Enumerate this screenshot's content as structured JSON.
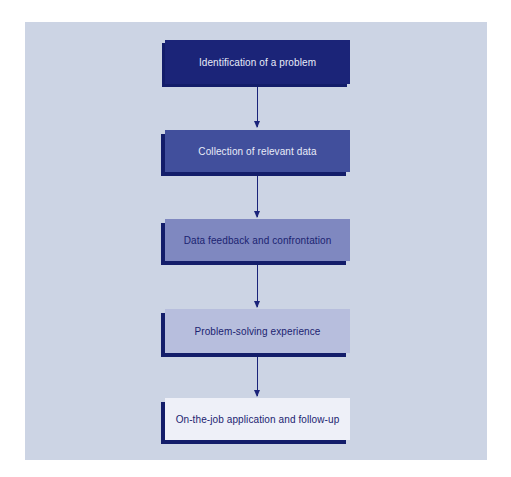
{
  "diagram": {
    "type": "flowchart",
    "direction": "top-to-bottom",
    "steps": [
      {
        "label": "Identification of a problem",
        "fill": "#1b2478",
        "text_color": "#e8ecf8"
      },
      {
        "label": "Collection of relevant data",
        "fill": "#414f9c",
        "text_color": "#e8ecf8"
      },
      {
        "label": "Data feedback and confrontation",
        "fill": "#7f88c0",
        "text_color": "#1b2370"
      },
      {
        "label": "Problem-solving experience",
        "fill": "#b7bedd",
        "text_color": "#1b2370"
      },
      {
        "label": "On-the-job application and follow-up",
        "fill": "#eef0f8",
        "text_color": "#1b2370"
      }
    ],
    "connectors": [
      {
        "from": 0,
        "to": 1
      },
      {
        "from": 1,
        "to": 2
      },
      {
        "from": 2,
        "to": 3
      },
      {
        "from": 3,
        "to": 4
      }
    ],
    "colors": {
      "background_panel": "#ccd4e4",
      "shadow": "#131d6a",
      "arrow": "#1a237a"
    }
  }
}
